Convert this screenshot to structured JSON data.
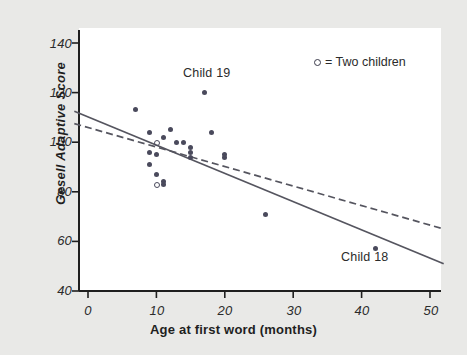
{
  "chart_data": {
    "type": "scatter",
    "title": "",
    "xlabel": "Age at first word (months)",
    "ylabel": "Gesell Adaptive Score",
    "xlim": [
      -2,
      52
    ],
    "ylim": [
      38,
      146
    ],
    "xticks": [
      0,
      10,
      20,
      30,
      40,
      50
    ],
    "yticks": [
      40,
      60,
      80,
      100,
      120,
      140
    ],
    "grid": false,
    "legend": {
      "position": "top-right",
      "marker": "open-circle",
      "text": "= Two children",
      "full_text": "○ = Two children"
    },
    "points": [
      {
        "x": 7,
        "y": 113,
        "marker": "filled"
      },
      {
        "x": 9,
        "y": 104,
        "marker": "filled"
      },
      {
        "x": 9,
        "y": 96,
        "marker": "filled"
      },
      {
        "x": 9,
        "y": 91,
        "marker": "filled"
      },
      {
        "x": 10,
        "y": 100,
        "marker": "open",
        "count": 2
      },
      {
        "x": 10,
        "y": 95,
        "marker": "filled"
      },
      {
        "x": 10,
        "y": 87,
        "marker": "filled"
      },
      {
        "x": 10,
        "y": 83,
        "marker": "open",
        "count": 2
      },
      {
        "x": 11,
        "y": 84,
        "marker": "filled"
      },
      {
        "x": 11,
        "y": 102,
        "marker": "filled"
      },
      {
        "x": 11,
        "y": 83,
        "marker": "filled"
      },
      {
        "x": 12,
        "y": 105,
        "marker": "filled"
      },
      {
        "x": 13,
        "y": 100,
        "marker": "filled"
      },
      {
        "x": 14,
        "y": 100,
        "marker": "filled"
      },
      {
        "x": 15,
        "y": 94,
        "marker": "filled"
      },
      {
        "x": 15,
        "y": 98,
        "marker": "filled"
      },
      {
        "x": 15,
        "y": 96,
        "marker": "filled"
      },
      {
        "x": 17,
        "y": 120,
        "marker": "filled",
        "label": "Child 19"
      },
      {
        "x": 18,
        "y": 104,
        "marker": "filled"
      },
      {
        "x": 20,
        "y": 94,
        "marker": "filled"
      },
      {
        "x": 20,
        "y": 95,
        "marker": "filled"
      },
      {
        "x": 26,
        "y": 71,
        "marker": "filled"
      },
      {
        "x": 42,
        "y": 57,
        "marker": "filled",
        "label": "Child 18"
      }
    ],
    "lines": [
      {
        "name": "regression-all-data",
        "style": "solid",
        "color": "#55555f",
        "x1": -2,
        "y1": 112.5,
        "x2": 52,
        "y2": 51.0
      },
      {
        "name": "regression-excluding-child-18",
        "style": "dashed",
        "color": "#55555f",
        "x1": -2,
        "y1": 107.5,
        "x2": 52,
        "y2": 65.0
      }
    ],
    "annotations": [
      {
        "name": "child-19-label",
        "text": "Child 19",
        "x": 17,
        "y": 129
      },
      {
        "name": "child-18-label",
        "text": "Child 18",
        "x": 42,
        "y": 50
      }
    ],
    "colors": {
      "background": "#e9e9e7",
      "plot_background": "#ffffff",
      "axis": "#1f1f1f",
      "marker": "#4a4a5c",
      "line": "#55555f"
    }
  },
  "axis": {
    "x_tick_labels": [
      "0",
      "10",
      "20",
      "30",
      "40",
      "50"
    ],
    "y_tick_labels": [
      "40",
      "60",
      "80",
      "100",
      "120",
      "140"
    ],
    "x_title": "Age at first word (months)",
    "y_title": "Gesell Adaptive Score"
  },
  "legend": {
    "text": "= Two children"
  },
  "annotations": {
    "child19": "Child 19",
    "child18": "Child 18"
  }
}
